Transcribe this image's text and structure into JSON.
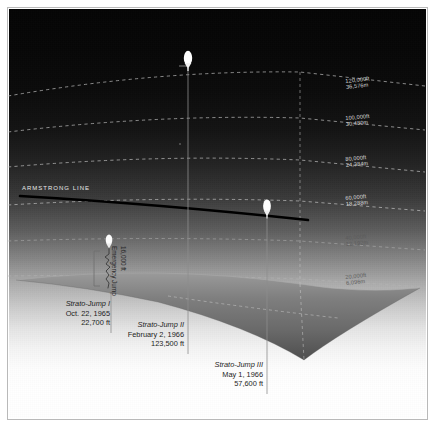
{
  "figure": {
    "kind": "altitude-profile-diagram",
    "armstrong_line_label": "ARMSTRONG LINE",
    "sky_top_color": "#050505",
    "sky_horizon_color": "#ffffff",
    "earth_color": "#6e6e6e",
    "grid_color": "#d9d9d9",
    "frame_color": "#b9b9b9"
  },
  "altitude_grid": [
    {
      "id": "g120",
      "ft": "120,000ft",
      "m": "36,576m",
      "label_x": 337,
      "label_y": 71,
      "tone": "light"
    },
    {
      "id": "g100",
      "ft": "100,000ft",
      "m": "30,480m",
      "label_x": 337,
      "label_y": 108,
      "tone": "light"
    },
    {
      "id": "g80",
      "ft": "80,000ft",
      "m": "24,384m",
      "label_x": 337,
      "label_y": 149,
      "tone": "light"
    },
    {
      "id": "g60",
      "ft": "60,000ft",
      "m": "18,288m",
      "label_x": 337,
      "label_y": 188,
      "tone": "light"
    },
    {
      "id": "g40",
      "ft": "40,000ft",
      "m": "12,192m",
      "label_x": 337,
      "label_y": 228,
      "tone": "dark"
    },
    {
      "id": "g20",
      "ft": "20,000ft",
      "m": "6,096m",
      "label_x": 337,
      "label_y": 268,
      "tone": "dark"
    }
  ],
  "emergency_jump": {
    "title": "Emergency Jump",
    "altitude": "16,000 ft"
  },
  "jumps": [
    {
      "id": "strato-jump-1",
      "title": "Strato-Jump I",
      "date": "Oct. 22, 1965",
      "altitude": "22,700 ft",
      "callout_x": 38,
      "callout_y": 292,
      "balloon_x": 103,
      "balloon_y": 232,
      "leader_x": 103,
      "leader_y_top": 238,
      "leader_y_bottom": 325
    },
    {
      "id": "strato-jump-2",
      "title": "Strato-Jump II",
      "date": "February 2, 1966",
      "altitude": "123,500 ft",
      "callout_x": 118,
      "callout_y": 313,
      "balloon_x": 180,
      "balloon_y": 50,
      "leader_x": 180,
      "leader_y_top": 58,
      "leader_y_bottom": 346
    },
    {
      "id": "strato-jump-3",
      "title": "Strato-Jump III",
      "date": "May 1, 1966",
      "altitude": "57,600 ft",
      "callout_x": 188,
      "callout_y": 353,
      "balloon_x": 259,
      "balloon_y": 198,
      "leader_x": 259,
      "leader_y_top": 206,
      "leader_y_bottom": 386
    }
  ]
}
